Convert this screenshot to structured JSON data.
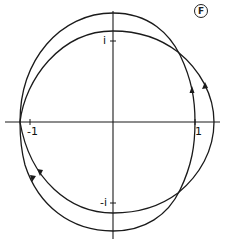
{
  "figure": {
    "panel_label": "F",
    "stroke_color": "#1a1a1a",
    "background": "#ffffff"
  },
  "axes": {
    "real_ticks": [
      {
        "label": "-1",
        "value": -1
      },
      {
        "label": "1",
        "value": 1
      }
    ],
    "imag_ticks": [
      {
        "label": "i",
        "value": 1
      },
      {
        "label": "-i",
        "value": -1
      }
    ]
  },
  "curves": [
    {
      "name": "curve-a",
      "orientation": "counterclockwise",
      "shape": "taller, narrower loop"
    },
    {
      "name": "curve-b",
      "orientation": "counterclockwise",
      "shape": "wider, shorter loop"
    }
  ]
}
